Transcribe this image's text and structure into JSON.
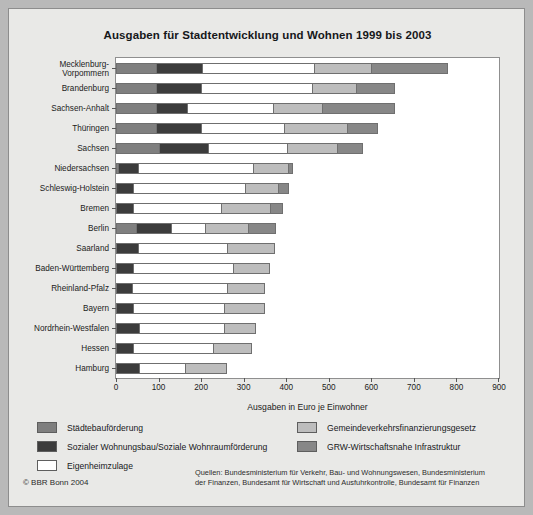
{
  "chart_data": {
    "type": "bar",
    "orientation": "horizontal",
    "stacked": true,
    "title": "Ausgaben für Stadtentwicklung und Wohnen 1999 bis 2003",
    "xlabel": "Ausgaben in Euro je Einwohner",
    "ylabel": "",
    "xlim": [
      0,
      900
    ],
    "xticks": [
      0,
      100,
      200,
      300,
      400,
      500,
      600,
      700,
      800,
      900
    ],
    "xticklabels": [
      "0",
      "100",
      "200",
      "300",
      "400",
      "500",
      "600",
      "700",
      "800",
      "900"
    ],
    "grid": false,
    "legend_position": "below-plot",
    "series": [
      {
        "name": "Städtebauförderung",
        "color": "#7f7f7f",
        "values": [
          95,
          95,
          95,
          95,
          100,
          5,
          0,
          0,
          46,
          0,
          0,
          0,
          0,
          0,
          0,
          0
        ]
      },
      {
        "name": "Sozialer Wohnungsbau/Soziale Wohnraumförderung",
        "color": "#3c3c3c",
        "values": [
          107,
          105,
          73,
          105,
          117,
          46,
          41,
          41,
          83,
          51,
          39,
          37,
          39,
          54,
          41,
          54
        ]
      },
      {
        "name": "Eigenheimzulage",
        "color": "#ffffff",
        "values": [
          264,
          260,
          202,
          195,
          185,
          271,
          261,
          205,
          81,
          210,
          237,
          224,
          215,
          200,
          188,
          107
        ]
      },
      {
        "name": "Gemeindeverkehrsfinanzierungsgesetz",
        "color": "#bdbdbd",
        "values": [
          134,
          103,
          113,
          149,
          118,
          83,
          78,
          117,
          100,
          112,
          87,
          90,
          95,
          75,
          91,
          100
        ]
      },
      {
        "name": "GRW-Wirtschaftsnahe Infrastruktur",
        "color": "#878787",
        "values": [
          180,
          92,
          172,
          71,
          60,
          12,
          27,
          30,
          66,
          0,
          0,
          0,
          0,
          0,
          0,
          0
        ]
      }
    ],
    "categories": [
      "Mecklenburg-\nVorpommern",
      "Brandenburg",
      "Sachsen-Anhalt",
      "Thüringen",
      "Sachsen",
      "Niedersachsen",
      "Schleswig-Holstein",
      "Bremen",
      "Berlin",
      "Saarland",
      "Baden-Württemberg",
      "Rheinland-Pfalz",
      "Bayern",
      "Nordrhein-Westfalen",
      "Hessen",
      "Hamburg"
    ],
    "totals": [
      780,
      655,
      655,
      615,
      580,
      417,
      407,
      393,
      376,
      373,
      363,
      351,
      349,
      329,
      320,
      261
    ]
  },
  "legend": {
    "items": [
      {
        "label": "Städtebauförderung",
        "color": "#7f7f7f"
      },
      {
        "label": "Sozialer Wohnungsbau/Soziale Wohnraumförderung",
        "color": "#3c3c3c"
      },
      {
        "label": "Eigenheimzulage",
        "color": "#ffffff"
      },
      {
        "label": "Gemeindeverkehrsfinanzierungsgesetz",
        "color": "#bdbdbd"
      },
      {
        "label": "GRW-Wirtschaftsnahe Infrastruktur",
        "color": "#878787"
      }
    ]
  },
  "footer": {
    "copyright": "© BBR Bonn 2004",
    "sources_line1": "Quellen: Bundesministerium für Verkehr, Bau- und Wohnungswesen, Bundesministerium",
    "sources_line2": "der Finanzen, Bundesamt für Wirtschaft und Ausfuhrkontrolle, Bundesamt für Finanzen"
  }
}
